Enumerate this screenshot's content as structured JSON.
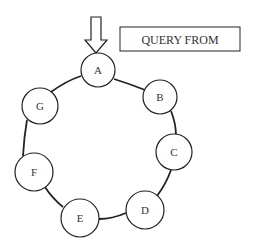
{
  "diagram": {
    "query_box": {
      "label": "QUERY FROM"
    },
    "entry_arrow": {
      "direction": "down",
      "target": "A"
    },
    "nodes": [
      {
        "id": "A",
        "label": "A"
      },
      {
        "id": "B",
        "label": "B"
      },
      {
        "id": "C",
        "label": "C"
      },
      {
        "id": "D",
        "label": "D"
      },
      {
        "id": "E",
        "label": "E"
      },
      {
        "id": "F",
        "label": "F"
      },
      {
        "id": "G",
        "label": "G"
      }
    ],
    "edges": [
      [
        "A",
        "B"
      ],
      [
        "B",
        "C"
      ],
      [
        "C",
        "D"
      ],
      [
        "D",
        "E"
      ],
      [
        "E",
        "F"
      ],
      [
        "F",
        "G"
      ],
      [
        "G",
        "A"
      ]
    ],
    "layout": "ring",
    "colors": {
      "stroke": "#222222",
      "background": "#ffffff",
      "text": "#333333"
    }
  }
}
